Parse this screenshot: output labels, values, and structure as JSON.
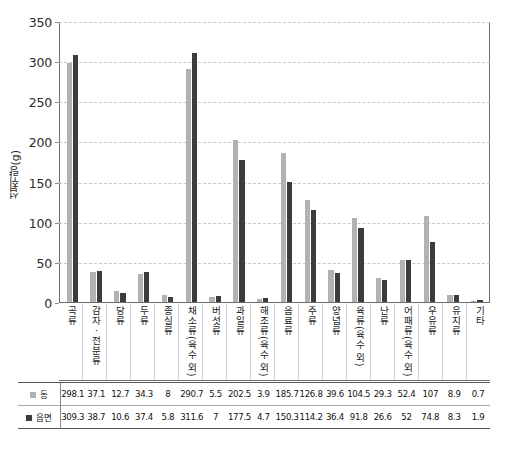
{
  "chart_data": {
    "type": "bar",
    "title": "",
    "xlabel": "",
    "ylabel": "섭취량(g)",
    "ylim": [
      0,
      350
    ],
    "yticks": [
      0,
      50,
      100,
      150,
      200,
      250,
      300,
      350
    ],
    "grid": true,
    "legend_position": "table-left",
    "categories": [
      "곡류",
      "감자ㆍ전분류",
      "당류",
      "두류",
      "종실류",
      "채소류(육수 외)",
      "버섯류",
      "과일류",
      "해조류(육수 외)",
      "음료류",
      "주류",
      "양념류",
      "육류(육수 외)",
      "난류",
      "어패류(육수 외)",
      "우유류",
      "유지류",
      "기타"
    ],
    "series": [
      {
        "name": "동",
        "color": "#b2b2b2",
        "values": [
          298.1,
          37.1,
          12.7,
          34.3,
          8,
          290.7,
          5.5,
          202.5,
          3.9,
          185.7,
          126.8,
          39.6,
          104.5,
          29.3,
          52.4,
          107,
          8.9,
          0.7
        ]
      },
      {
        "name": "읍면",
        "color": "#3c3c3c",
        "values": [
          309.3,
          38.7,
          10.6,
          37.4,
          5.8,
          311.6,
          7,
          177.5,
          4.7,
          150.3,
          114.2,
          36.4,
          91.8,
          26.6,
          52,
          74.8,
          8.3,
          1.9
        ]
      }
    ]
  },
  "caption": "",
  "legend": {
    "dong_label": "동",
    "eupmyeon_label": "읍면"
  }
}
